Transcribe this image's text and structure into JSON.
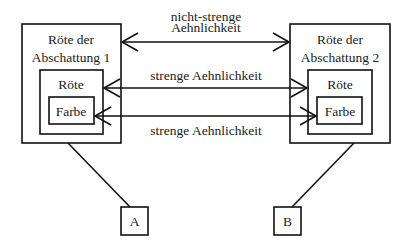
{
  "left_group": {
    "outer_label_line1": "Röte der",
    "outer_label_line2": "Abschattung 1",
    "inner_label": "Röte",
    "core_label": "Farbe"
  },
  "right_group": {
    "outer_label_line1": "Röte der",
    "outer_label_line2": "Abschattung 2",
    "inner_label": "Röte",
    "core_label": "Farbe"
  },
  "relations": [
    {
      "label_line1": "nicht-strenge",
      "label_line2": "Aehnlichkeit",
      "connects": "outer boxes"
    },
    {
      "label_line1": "strenge Aehnlichkeit",
      "connects": "Röte boxes"
    },
    {
      "label_line1": "strenge Aehnlichkeit",
      "connects": "Farbe boxes"
    }
  ],
  "observers": [
    {
      "label": "A"
    },
    {
      "label": "B"
    }
  ],
  "colors": {
    "stroke": "#111111",
    "text": "#222222",
    "background": "#ffffff"
  }
}
